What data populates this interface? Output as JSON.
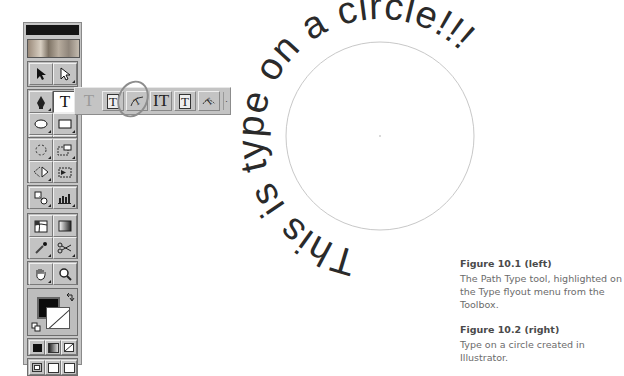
{
  "toolbox": {
    "title": "",
    "tools": [
      {
        "name": "selection-tool",
        "icon": "arrow-icon"
      },
      {
        "name": "direct-selection-tool",
        "icon": "hollow-arrow-icon"
      },
      {
        "name": "pen-tool",
        "icon": "pen-nib-icon"
      },
      {
        "name": "type-tool",
        "icon": "type-T-icon",
        "glyph": "T",
        "active": true
      },
      {
        "name": "ellipse-tool",
        "icon": "ellipse-icon"
      },
      {
        "name": "rectangle-tool",
        "icon": "rectangle-icon"
      },
      {
        "name": "paintbrush-tool",
        "icon": "brush-icon"
      },
      {
        "name": "pencil-tool",
        "icon": "pencil-icon"
      },
      {
        "name": "rotate-tool",
        "icon": "rotate-icon"
      },
      {
        "name": "scale-tool",
        "icon": "scale-icon"
      },
      {
        "name": "reflect-tool",
        "icon": "reflect-icon"
      },
      {
        "name": "free-transform-tool",
        "icon": "free-transform-icon"
      },
      {
        "name": "blend-tool",
        "icon": "blend-icon"
      },
      {
        "name": "graph-tool",
        "icon": "bar-graph-icon"
      },
      {
        "name": "mesh-tool",
        "icon": "mesh-icon"
      },
      {
        "name": "gradient-tool",
        "icon": "gradient-icon"
      },
      {
        "name": "eyedropper-tool",
        "icon": "eyedropper-icon"
      },
      {
        "name": "scissors-tool",
        "icon": "scissors-icon"
      },
      {
        "name": "hand-tool",
        "icon": "hand-icon"
      },
      {
        "name": "zoom-tool",
        "icon": "magnifier-icon"
      }
    ],
    "fill_color": "#0c0c0c",
    "stroke_color": "none",
    "swap_icon": "swap-arrows-icon",
    "default_icon": "default-colors-icon",
    "color_modes": [
      "color",
      "gradient",
      "none"
    ],
    "screen_modes": [
      "standard",
      "full-with-menu",
      "full"
    ]
  },
  "flyout": {
    "tools": [
      {
        "name": "type-tool",
        "glyph": "T",
        "dim": true
      },
      {
        "name": "area-type-tool",
        "glyph": "T",
        "boxed": true
      },
      {
        "name": "path-type-tool",
        "glyph": "↯",
        "highlighted": true
      },
      {
        "name": "vertical-type-tool",
        "glyph": "IT"
      },
      {
        "name": "vertical-area-type-tool",
        "glyph": "T",
        "boxed": true
      },
      {
        "name": "vertical-path-type-tool",
        "glyph": "↯"
      }
    ],
    "tearoff": "·"
  },
  "artwork": {
    "path_text": "This is type on a circle!!!",
    "circle": {
      "cx": 380,
      "cy": 136,
      "r": 94,
      "stroke": "#c8c8c8"
    },
    "text_color": "#2a2a2a"
  },
  "captions": [
    {
      "title": "Figure 10.1 (left)",
      "body": "The Path Type tool, highlighted on the Type flyout menu from the Toolbox."
    },
    {
      "title": "Figure 10.2 (right)",
      "body": "Type on a circle created in Illustrator."
    }
  ]
}
